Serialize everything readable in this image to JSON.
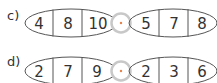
{
  "exercises": [
    {
      "label": "c)",
      "left": [
        "4",
        "8",
        "10"
      ],
      "operator": "·",
      "right": [
        "5",
        "7",
        "8"
      ]
    },
    {
      "label": "d)",
      "left": [
        "2",
        "7",
        "9"
      ],
      "operator": "·",
      "right": [
        "2",
        "3",
        "6"
      ]
    }
  ],
  "colors": {
    "stroke": "#555555",
    "ring": "#c8c8c8",
    "dot": "#e8834a",
    "text": "#333333"
  }
}
